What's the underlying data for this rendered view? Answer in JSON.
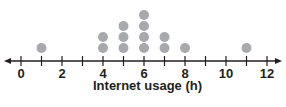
{
  "chart_data": {
    "type": "dot-plot",
    "title": "",
    "xlabel": "Internet usage (h)",
    "ylabel": "",
    "xlim": [
      0,
      12
    ],
    "x_ticks": [
      0,
      1,
      2,
      3,
      4,
      5,
      6,
      7,
      8,
      9,
      10,
      11,
      12
    ],
    "x_tick_labels": [
      "0",
      "2",
      "4",
      "6",
      "8",
      "10",
      "12"
    ],
    "x_tick_label_values": [
      0,
      2,
      4,
      6,
      8,
      10,
      12
    ],
    "points": [
      {
        "x": 1,
        "count": 1
      },
      {
        "x": 4,
        "count": 2
      },
      {
        "x": 5,
        "count": 3
      },
      {
        "x": 6,
        "count": 4
      },
      {
        "x": 7,
        "count": 2
      },
      {
        "x": 8,
        "count": 1
      },
      {
        "x": 11,
        "count": 1
      }
    ],
    "total": 14,
    "grid": false,
    "legend": null,
    "colors": {
      "dot": "#a7a9ac",
      "axis": "#231f20"
    }
  }
}
